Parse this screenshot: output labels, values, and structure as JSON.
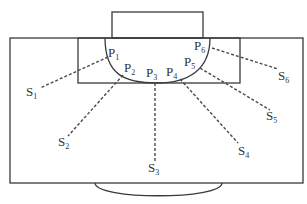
{
  "diagram": {
    "points": [
      {
        "id": "P1",
        "base": "P",
        "index": "1"
      },
      {
        "id": "P2",
        "base": "P",
        "index": "2"
      },
      {
        "id": "P3",
        "base": "P",
        "index": "3"
      },
      {
        "id": "P4",
        "base": "P",
        "index": "4"
      },
      {
        "id": "P5",
        "base": "P",
        "index": "5"
      },
      {
        "id": "P6",
        "base": "P",
        "index": "6"
      }
    ],
    "sensors": [
      {
        "id": "S1",
        "base": "S",
        "index": "1"
      },
      {
        "id": "S2",
        "base": "S",
        "index": "2"
      },
      {
        "id": "S3",
        "base": "S",
        "index": "3"
      },
      {
        "id": "S4",
        "base": "S",
        "index": "4"
      },
      {
        "id": "S5",
        "base": "S",
        "index": "5"
      },
      {
        "id": "S6",
        "base": "S",
        "index": "6"
      }
    ],
    "connections": [
      {
        "from": "P1",
        "to": "S1"
      },
      {
        "from": "P2",
        "to": "S2"
      },
      {
        "from": "P3",
        "to": "S3"
      },
      {
        "from": "P4",
        "to": "S4"
      },
      {
        "from": "P5",
        "to": "S5"
      },
      {
        "from": "P6",
        "to": "S6"
      }
    ],
    "colors": {
      "stroke": "#3a3a3a",
      "background": "#ffffff"
    }
  }
}
